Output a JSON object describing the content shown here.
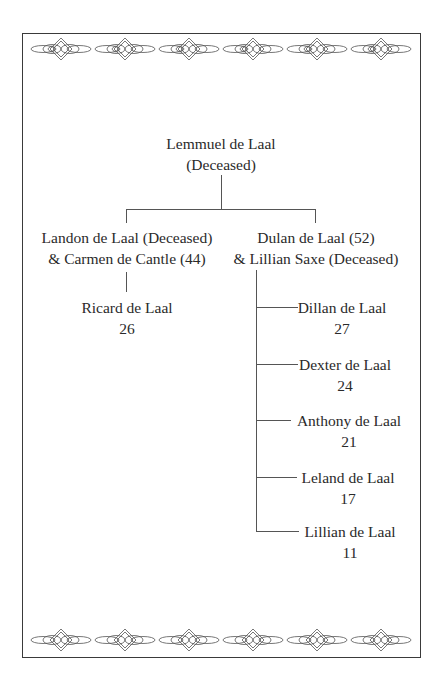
{
  "family_tree": {
    "root": {
      "name": "Lemmuel de Laal",
      "status": "(Deceased)"
    },
    "branches": [
      {
        "line1": "Landon de Laal (Deceased)",
        "line2": "& Carmen de Cantle (44)",
        "children": [
          {
            "name": "Ricard de Laal",
            "age": "26"
          }
        ]
      },
      {
        "line1": "Dulan de Laal (52)",
        "line2": "& Lillian Saxe (Deceased)",
        "children": [
          {
            "name": "Dillan de Laal",
            "age": "27"
          },
          {
            "name": "Dexter de Laal",
            "age": "24"
          },
          {
            "name": "Anthony de Laal",
            "age": "21"
          },
          {
            "name": "Leland de Laal",
            "age": "17"
          },
          {
            "name": "Lillian de Laal",
            "age": "11"
          }
        ]
      }
    ]
  },
  "decoration": {
    "ornament": "chain-diamond-border",
    "ornament_count": 6
  }
}
